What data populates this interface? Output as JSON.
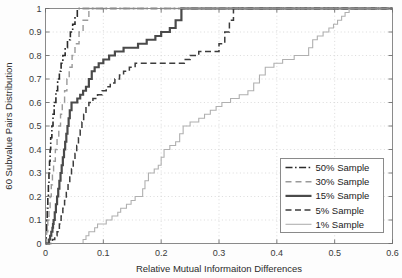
{
  "chart_data": {
    "type": "line",
    "title": "",
    "xlabel": "Relative Mutual Informaiton Differences",
    "ylabel": "60 Subvalue Pairs Distribution",
    "xlim": [
      0,
      0.6
    ],
    "ylim": [
      0,
      1
    ],
    "xticks": [
      "0",
      "0.1",
      "0.2",
      "0.3",
      "0.4",
      "0.5",
      "0.6"
    ],
    "xtick_values": [
      0,
      0.1,
      0.2,
      0.3,
      0.4,
      0.5,
      0.6
    ],
    "yticks": [
      "0",
      "0.1",
      "0.2",
      "0.3",
      "0.4",
      "0.5",
      "0.6",
      "0.7",
      "0.8",
      "0.9",
      "1"
    ],
    "ytick_values": [
      0,
      0.1,
      0.2,
      0.3,
      0.4,
      0.5,
      0.6,
      0.7,
      0.8,
      0.9,
      1
    ],
    "grid": true,
    "legend_position": "lower right",
    "series": [
      {
        "name": "50% Sample",
        "style": "dashdot",
        "color": "#2b2b2b",
        "width": 1.6,
        "dash": "7,2.5,1.6,2.5",
        "points": [
          [
            0.0,
            0.0
          ],
          [
            0.001,
            0.05
          ],
          [
            0.002,
            0.1
          ],
          [
            0.003,
            0.15
          ],
          [
            0.004,
            0.2
          ],
          [
            0.005,
            0.25
          ],
          [
            0.006,
            0.3
          ],
          [
            0.007,
            0.35
          ],
          [
            0.008,
            0.4
          ],
          [
            0.009,
            0.45
          ],
          [
            0.011,
            0.5
          ],
          [
            0.013,
            0.55
          ],
          [
            0.015,
            0.6
          ],
          [
            0.018,
            0.65
          ],
          [
            0.021,
            0.7
          ],
          [
            0.024,
            0.733
          ],
          [
            0.027,
            0.767
          ],
          [
            0.03,
            0.8
          ],
          [
            0.034,
            0.833
          ],
          [
            0.038,
            0.867
          ],
          [
            0.043,
            0.9
          ],
          [
            0.047,
            0.933
          ],
          [
            0.051,
            0.967
          ],
          [
            0.055,
            1.0
          ],
          [
            0.6,
            1.0
          ]
        ]
      },
      {
        "name": "30% Sample",
        "style": "dashed-light",
        "color": "#9a9a9a",
        "width": 1.4,
        "dash": "6,4",
        "points": [
          [
            0.0,
            0.0
          ],
          [
            0.002,
            0.05
          ],
          [
            0.004,
            0.1
          ],
          [
            0.006,
            0.15
          ],
          [
            0.008,
            0.2
          ],
          [
            0.01,
            0.25
          ],
          [
            0.012,
            0.3
          ],
          [
            0.014,
            0.35
          ],
          [
            0.017,
            0.4
          ],
          [
            0.02,
            0.45
          ],
          [
            0.023,
            0.5
          ],
          [
            0.026,
            0.55
          ],
          [
            0.029,
            0.6
          ],
          [
            0.033,
            0.65
          ],
          [
            0.037,
            0.7
          ],
          [
            0.041,
            0.75
          ],
          [
            0.046,
            0.8
          ],
          [
            0.051,
            0.85
          ],
          [
            0.058,
            0.9
          ],
          [
            0.065,
            0.95
          ],
          [
            0.075,
            1.0
          ],
          [
            0.6,
            1.0
          ]
        ]
      },
      {
        "name": "15% Sample",
        "style": "solid-bold",
        "color": "#4a4a4a",
        "width": 2.2,
        "dash": "",
        "points": [
          [
            0.0,
            0.0
          ],
          [
            0.006,
            0.017
          ],
          [
            0.008,
            0.033
          ],
          [
            0.01,
            0.05
          ],
          [
            0.012,
            0.067
          ],
          [
            0.013,
            0.083
          ],
          [
            0.014,
            0.1
          ],
          [
            0.016,
            0.133
          ],
          [
            0.018,
            0.167
          ],
          [
            0.02,
            0.2
          ],
          [
            0.022,
            0.233
          ],
          [
            0.024,
            0.267
          ],
          [
            0.026,
            0.3
          ],
          [
            0.028,
            0.333
          ],
          [
            0.03,
            0.367
          ],
          [
            0.032,
            0.4
          ],
          [
            0.034,
            0.433
          ],
          [
            0.036,
            0.467
          ],
          [
            0.038,
            0.5
          ],
          [
            0.04,
            0.533
          ],
          [
            0.042,
            0.567
          ],
          [
            0.045,
            0.6
          ],
          [
            0.055,
            0.617
          ],
          [
            0.06,
            0.633
          ],
          [
            0.065,
            0.65
          ],
          [
            0.07,
            0.667
          ],
          [
            0.075,
            0.7
          ],
          [
            0.08,
            0.733
          ],
          [
            0.085,
            0.75
          ],
          [
            0.092,
            0.767
          ],
          [
            0.1,
            0.783
          ],
          [
            0.11,
            0.8
          ],
          [
            0.12,
            0.817
          ],
          [
            0.135,
            0.833
          ],
          [
            0.16,
            0.85
          ],
          [
            0.175,
            0.867
          ],
          [
            0.19,
            0.883
          ],
          [
            0.2,
            0.9
          ],
          [
            0.215,
            0.917
          ],
          [
            0.225,
            0.95
          ],
          [
            0.235,
            1.0
          ],
          [
            0.6,
            1.0
          ]
        ]
      },
      {
        "name": "5% Sample",
        "style": "dashed",
        "color": "#3c3c3c",
        "width": 1.5,
        "dash": "6,3.5",
        "points": [
          [
            0.0,
            0.0
          ],
          [
            0.012,
            0.017
          ],
          [
            0.016,
            0.033
          ],
          [
            0.02,
            0.05
          ],
          [
            0.024,
            0.083
          ],
          [
            0.027,
            0.117
          ],
          [
            0.03,
            0.15
          ],
          [
            0.033,
            0.183
          ],
          [
            0.036,
            0.217
          ],
          [
            0.039,
            0.25
          ],
          [
            0.042,
            0.283
          ],
          [
            0.045,
            0.317
          ],
          [
            0.048,
            0.35
          ],
          [
            0.051,
            0.383
          ],
          [
            0.054,
            0.417
          ],
          [
            0.057,
            0.45
          ],
          [
            0.06,
            0.483
          ],
          [
            0.063,
            0.517
          ],
          [
            0.066,
            0.55
          ],
          [
            0.07,
            0.583
          ],
          [
            0.075,
            0.6
          ],
          [
            0.082,
            0.617
          ],
          [
            0.09,
            0.633
          ],
          [
            0.098,
            0.65
          ],
          [
            0.105,
            0.667
          ],
          [
            0.112,
            0.683
          ],
          [
            0.12,
            0.7
          ],
          [
            0.128,
            0.717
          ],
          [
            0.135,
            0.733
          ],
          [
            0.145,
            0.75
          ],
          [
            0.155,
            0.767
          ],
          [
            0.23,
            0.767
          ],
          [
            0.24,
            0.783
          ],
          [
            0.25,
            0.8
          ],
          [
            0.265,
            0.817
          ],
          [
            0.29,
            0.817
          ],
          [
            0.3,
            0.85
          ],
          [
            0.31,
            0.9
          ],
          [
            0.318,
            0.95
          ],
          [
            0.325,
            1.0
          ],
          [
            0.6,
            1.0
          ]
        ]
      },
      {
        "name": "1% Sample",
        "style": "solid-thin",
        "color": "#b0b0b0",
        "width": 1.1,
        "dash": "",
        "points": [
          [
            0.0,
            0.0
          ],
          [
            0.06,
            0.0
          ],
          [
            0.065,
            0.017
          ],
          [
            0.07,
            0.033
          ],
          [
            0.075,
            0.05
          ],
          [
            0.08,
            0.05
          ],
          [
            0.085,
            0.067
          ],
          [
            0.09,
            0.083
          ],
          [
            0.1,
            0.083
          ],
          [
            0.105,
            0.1
          ],
          [
            0.115,
            0.117
          ],
          [
            0.125,
            0.133
          ],
          [
            0.13,
            0.15
          ],
          [
            0.14,
            0.167
          ],
          [
            0.148,
            0.183
          ],
          [
            0.155,
            0.2
          ],
          [
            0.165,
            0.2
          ],
          [
            0.168,
            0.233
          ],
          [
            0.172,
            0.267
          ],
          [
            0.178,
            0.3
          ],
          [
            0.188,
            0.317
          ],
          [
            0.195,
            0.333
          ],
          [
            0.2,
            0.367
          ],
          [
            0.205,
            0.4
          ],
          [
            0.215,
            0.417
          ],
          [
            0.225,
            0.433
          ],
          [
            0.232,
            0.467
          ],
          [
            0.238,
            0.5
          ],
          [
            0.25,
            0.517
          ],
          [
            0.265,
            0.533
          ],
          [
            0.275,
            0.55
          ],
          [
            0.285,
            0.567
          ],
          [
            0.295,
            0.583
          ],
          [
            0.305,
            0.6
          ],
          [
            0.32,
            0.617
          ],
          [
            0.335,
            0.633
          ],
          [
            0.35,
            0.65
          ],
          [
            0.36,
            0.683
          ],
          [
            0.37,
            0.717
          ],
          [
            0.38,
            0.75
          ],
          [
            0.395,
            0.767
          ],
          [
            0.41,
            0.783
          ],
          [
            0.43,
            0.8
          ],
          [
            0.45,
            0.8
          ],
          [
            0.455,
            0.833
          ],
          [
            0.462,
            0.867
          ],
          [
            0.47,
            0.883
          ],
          [
            0.48,
            0.9
          ],
          [
            0.49,
            0.917
          ],
          [
            0.498,
            0.933
          ],
          [
            0.505,
            0.95
          ],
          [
            0.512,
            0.967
          ],
          [
            0.518,
            0.983
          ],
          [
            0.525,
            1.0
          ],
          [
            0.6,
            1.0
          ]
        ]
      }
    ]
  },
  "legend": {
    "items": [
      {
        "label": "50% Sample"
      },
      {
        "label": "30% Sample"
      },
      {
        "label": "15% Sample"
      },
      {
        "label": "5% Sample"
      },
      {
        "label": "1% Sample"
      }
    ]
  }
}
